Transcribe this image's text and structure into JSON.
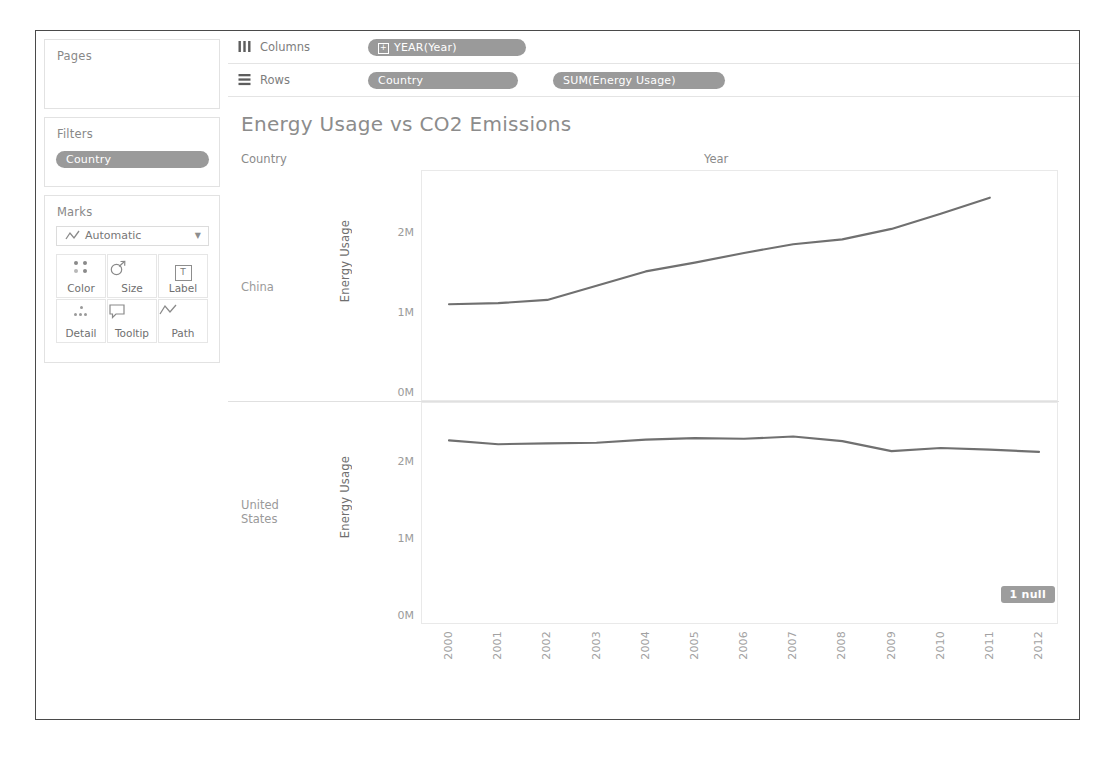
{
  "shelves": {
    "pages": {
      "title": "Pages"
    },
    "filters": {
      "title": "Filters",
      "pill": "Country"
    },
    "marks": {
      "title": "Marks",
      "type_label": "Automatic",
      "type_icon": "line-mark-icon",
      "buttons": [
        {
          "label": "Color",
          "icon": "color-icon"
        },
        {
          "label": "Size",
          "icon": "size-icon"
        },
        {
          "label": "Label",
          "icon": "label-icon"
        },
        {
          "label": "Detail",
          "icon": "detail-icon"
        },
        {
          "label": "Tooltip",
          "icon": "tooltip-icon"
        },
        {
          "label": "Path",
          "icon": "path-icon"
        }
      ]
    },
    "columns": {
      "label": "Columns",
      "icon": "columns-icon",
      "pills": [
        "YEAR(Year)"
      ]
    },
    "rows": {
      "label": "Rows",
      "icon": "rows-icon",
      "pills": [
        "Country",
        "SUM(Energy Usage)"
      ]
    }
  },
  "viz": {
    "title": "Energy Usage vs CO2 Emissions",
    "column_header_label": "Year",
    "row_header_label": "Country",
    "null_badge": "1 null",
    "row_headers": [
      "China",
      "United States"
    ],
    "expand_icon": "plus-box-icon"
  },
  "chart_data": {
    "type": "line",
    "title": "Energy Usage vs CO2 Emissions",
    "xlabel": "Year",
    "ylabel": "Energy Usage",
    "x": [
      2000,
      2001,
      2002,
      2003,
      2004,
      2005,
      2006,
      2007,
      2008,
      2009,
      2010,
      2011,
      2012
    ],
    "xtick_labels": [
      "2000",
      "2001",
      "2002",
      "2003",
      "2004",
      "2005",
      "2006",
      "2007",
      "2008",
      "2009",
      "2010",
      "2011",
      "2012"
    ],
    "ylim": [
      0,
      2600000
    ],
    "ytick_labels": [
      "0M",
      "1M",
      "2M"
    ],
    "ytick_values": [
      0,
      1000000,
      2000000
    ],
    "grid": false,
    "legend": "none",
    "panels": [
      {
        "name": "China",
        "series": [
          {
            "name": "SUM(Energy Usage)",
            "color": "#707070",
            "values": [
              1120000,
              1135000,
              1175000,
              1350000,
              1530000,
              1640000,
              1760000,
              1870000,
              1930000,
              2060000,
              2250000,
              2450000,
              null
            ]
          }
        ]
      },
      {
        "name": "United States",
        "series": [
          {
            "name": "SUM(Energy Usage)",
            "color": "#707070",
            "values": [
              2300000,
              2250000,
              2260000,
              2270000,
              2310000,
              2330000,
              2320000,
              2350000,
              2290000,
              2160000,
              2200000,
              2180000,
              2150000
            ]
          }
        ]
      }
    ],
    "null_count": 1,
    "null_note": "1 null"
  }
}
